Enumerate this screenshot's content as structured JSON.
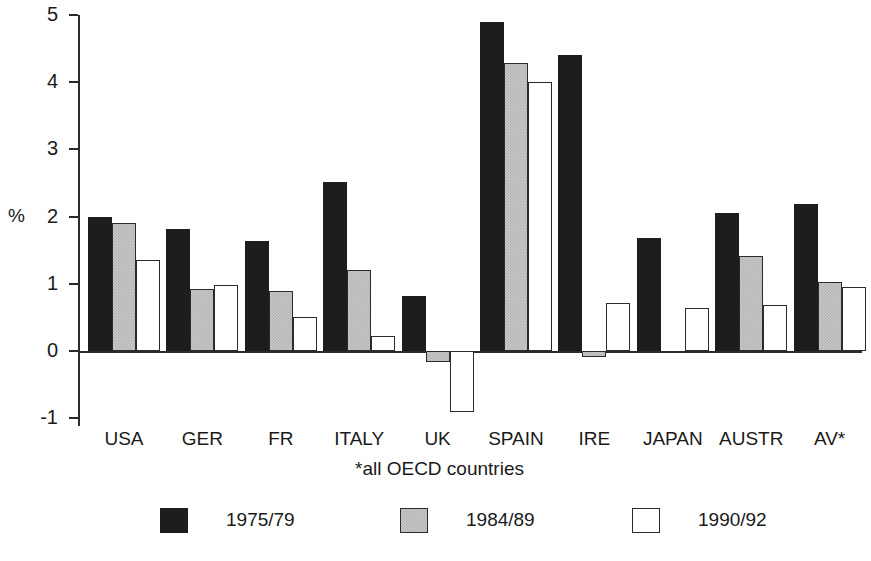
{
  "chart_data": {
    "type": "bar",
    "title": "",
    "subtitle": "",
    "xlabel": "",
    "ylabel": "%",
    "ylim": [
      -1,
      5
    ],
    "yticks": [
      -1,
      0,
      1,
      2,
      3,
      4,
      5
    ],
    "ytick_labels": [
      "-1",
      "0",
      "1",
      "2",
      "3",
      "4",
      "5"
    ],
    "grid": false,
    "legend_position": "bottom",
    "footnote": "*all OECD countries",
    "categories": [
      "USA",
      "GER",
      "FR",
      "ITALY",
      "UK",
      "SPAIN",
      "IRE",
      "JAPAN",
      "AUSTR",
      "AV*"
    ],
    "series": [
      {
        "name": "1975/79",
        "fill": "black",
        "color": "#1d1d1d",
        "values": [
          1.99,
          1.82,
          1.63,
          2.51,
          0.82,
          4.9,
          4.4,
          1.68,
          2.06,
          2.19
        ]
      },
      {
        "name": "1984/89",
        "fill": "gray",
        "color": "#c9c9c9",
        "values": [
          1.9,
          0.93,
          0.89,
          1.2,
          -0.17,
          4.29,
          -0.09,
          null,
          1.41,
          1.02
        ]
      },
      {
        "name": "1990/92",
        "fill": "white",
        "color": "#ffffff",
        "values": [
          1.36,
          0.98,
          0.51,
          0.23,
          -0.91,
          4.01,
          0.72,
          0.64,
          0.68,
          0.95
        ]
      }
    ]
  },
  "axis": {
    "y_title": "%"
  },
  "legend": {
    "items": [
      {
        "label": "1975/79",
        "fill": "black"
      },
      {
        "label": "1984/89",
        "fill": "gray"
      },
      {
        "label": "1990/92",
        "fill": "white"
      }
    ]
  }
}
